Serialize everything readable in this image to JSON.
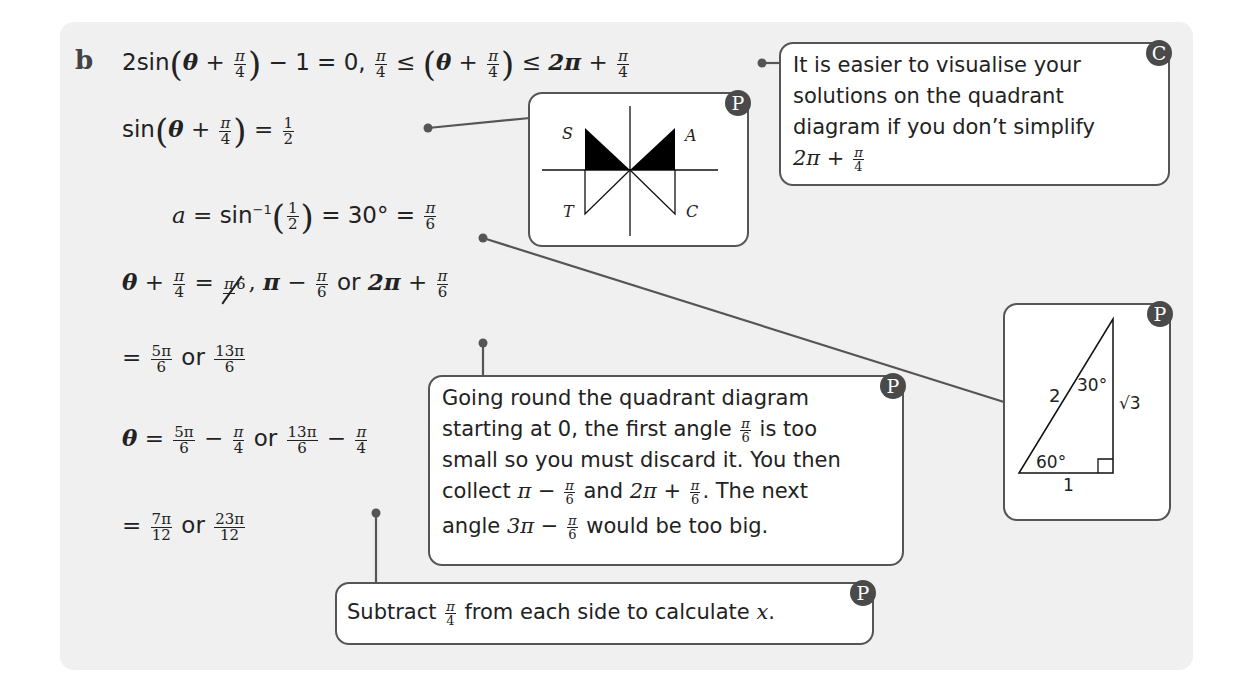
{
  "part_label": "b",
  "steps": [
    {
      "id": "step1",
      "text": "2sin(θ + π/4) − 1 = 0, π/4 ≤ (θ + π/4) ≤ 2π + π/4"
    },
    {
      "id": "step2",
      "text": "sin(θ + π/4) = 1/2"
    },
    {
      "id": "step3",
      "text": "a = sin⁻¹(1/2) = 30° = π/6"
    },
    {
      "id": "step4",
      "text": "θ + π/4 = π/6 (struck out), π − π/6 or 2π + π/6"
    },
    {
      "id": "step5",
      "text": "= 5π/6 or 13π/6"
    },
    {
      "id": "step6",
      "text": "θ = 5π/6 − π/4 or 13π/6 − π/4"
    },
    {
      "id": "step7",
      "text": "= 7π/12 or 23π/12"
    }
  ],
  "tokens": {
    "two_sin": "2sin",
    "sin": "sin",
    "theta": "θ",
    "plus": "+",
    "minus": "−",
    "equals": "=",
    "le": "≤",
    "pi": "π",
    "two_pi": "2π",
    "three_pi": "3π",
    "four": "4",
    "six": "6",
    "one": "1",
    "two": "2",
    "twelve": "12",
    "five_pi": "5π",
    "thirteen_pi": "13π",
    "seven_pi": "7π",
    "twentythree_pi": "23π",
    "minus_one_eq_zero": "− 1 = 0,",
    "or": "or",
    "comma": ",",
    "a_var": "a",
    "sin_inv": "sin",
    "inv_exp": "−1",
    "thirty_deg": "= 30° =",
    "lparen": "(",
    "rparen": ")"
  },
  "callouts": {
    "simplify_note": {
      "badge": "C",
      "lines": [
        "It is easier to visualise your",
        "solutions on the quadrant",
        "diagram if you don’t simplify"
      ],
      "last_line": "2π + π/4"
    },
    "quadrant_diagram": {
      "badge": "P",
      "labels": {
        "S": "S",
        "A": "A",
        "T": "T",
        "C": "C"
      }
    },
    "triangle_diagram": {
      "badge": "P",
      "hypotenuse": "2",
      "adjacent": "1",
      "opposite": "√3",
      "top_angle": "30°",
      "bottom_angle": "60°"
    },
    "going_round_note": {
      "badge": "P",
      "line1": "Going round the quadrant diagram",
      "line2_a": "starting at 0, the first angle",
      "line2_b": "is too",
      "line3": "small so you must discard it. You then",
      "line4_a": "collect",
      "line4_b": "and",
      "line4_c": ". The next",
      "line5_a": "angle",
      "line5_b": "would be too big."
    },
    "subtract_note": {
      "badge": "P",
      "text_a": "Subtract",
      "text_b": "from each side to calculate",
      "var": "x",
      "period": "."
    }
  },
  "colors": {
    "panel_bg": "#f0f0f0",
    "box_border": "#555555",
    "badge_bg": "#4a4a4a",
    "leader_line": "#555555"
  }
}
